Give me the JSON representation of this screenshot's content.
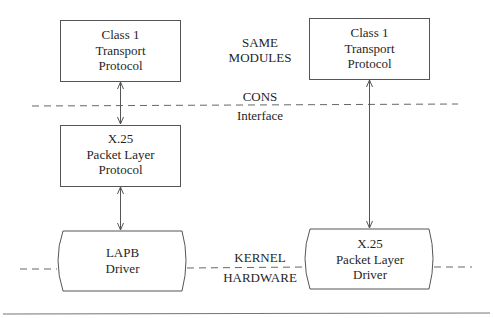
{
  "diagram": {
    "colors": {
      "stroke": "#555555",
      "text": "#1f1f1f",
      "background": "#ffffff"
    },
    "nodes": [
      {
        "id": "left-transport",
        "shape": "rect",
        "lines": [
          "Class 1",
          "Transport",
          "Protocol"
        ]
      },
      {
        "id": "right-transport",
        "shape": "rect",
        "lines": [
          "Class 1",
          "Transport",
          "Protocol"
        ]
      },
      {
        "id": "left-x25-plp",
        "shape": "rect",
        "lines": [
          "X.25",
          "Packet Layer",
          "Protocol"
        ]
      },
      {
        "id": "lapb-driver",
        "shape": "barrel",
        "lines": [
          "LAPB",
          "Driver"
        ]
      },
      {
        "id": "x25-plp-driver",
        "shape": "barrel",
        "lines": [
          "X.25",
          "Packet Layer",
          "Driver"
        ]
      }
    ],
    "edges": [
      {
        "from": "left-transport",
        "to": "left-x25-plp",
        "arrow": "both"
      },
      {
        "from": "left-x25-plp",
        "to": "lapb-driver",
        "arrow": "both"
      },
      {
        "from": "right-transport",
        "to": "x25-plp-driver",
        "arrow": "both"
      }
    ],
    "boundaries": [
      {
        "id": "cons-interface",
        "style": "dashed",
        "label_above": "CONS",
        "label_below": "Interface"
      },
      {
        "id": "kernel-hardware",
        "style": "dashed",
        "label_above": "KERNEL",
        "label_below": "HARDWARE"
      }
    ],
    "annotations": {
      "same_modules": [
        "SAME",
        "MODULES"
      ]
    }
  }
}
